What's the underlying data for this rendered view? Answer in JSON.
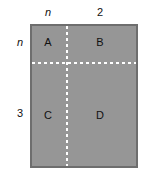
{
  "figure": {
    "type": "area-model-rectangle-diagram",
    "colors": {
      "fill": "#969696",
      "border": "#6e6e6e",
      "divider": "#ffffff",
      "text": "#111111",
      "background": "#ffffff"
    },
    "regions": [
      {
        "id": "A",
        "label": "A",
        "position": "top-left",
        "width_label": "n",
        "height_label": "n"
      },
      {
        "id": "B",
        "label": "B",
        "position": "top-right",
        "width_label": "2",
        "height_label": "n"
      },
      {
        "id": "C",
        "label": "C",
        "position": "bottom-left",
        "width_label": "n",
        "height_label": "3"
      },
      {
        "id": "D",
        "label": "D",
        "position": "bottom-right",
        "width_label": "2",
        "height_label": "3"
      }
    ],
    "top_labels": [
      {
        "text": "n",
        "italic": true,
        "over": "left-column"
      },
      {
        "text": "2",
        "italic": false,
        "over": "right-column"
      }
    ],
    "left_labels": [
      {
        "text": "n",
        "italic": true,
        "beside": "top-row"
      },
      {
        "text": "3",
        "italic": false,
        "beside": "bottom-row"
      }
    ]
  }
}
